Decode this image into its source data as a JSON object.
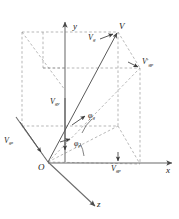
{
  "figure": {
    "type": "vector-decomposition-diagram",
    "colors": {
      "axis": "#6b6b6b",
      "dashed": "#8a8a8a",
      "vector": "#555555",
      "text": "#1a1a1a",
      "background": "#ffffff"
    },
    "axes": [
      {
        "id": "y",
        "label": "y",
        "direction": "up"
      },
      {
        "id": "x",
        "label": "x",
        "direction": "right"
      },
      {
        "id": "z",
        "label": "z",
        "direction": "down-right"
      }
    ],
    "points": [
      {
        "id": "origin",
        "label": "O"
      },
      {
        "id": "V",
        "label": "V"
      },
      {
        "id": "Vgp_prime",
        "label_base": "V",
        "label_sub": "gp",
        "prime": true
      },
      {
        "id": "Vgp",
        "label_base": "V",
        "label_sub": "gp",
        "prime": false
      }
    ],
    "vectors": [
      {
        "id": "Vg",
        "base": "V",
        "sub": "g",
        "description": "resultant vector from origin to V"
      },
      {
        "id": "Vgy",
        "base": "V",
        "sub": "gy",
        "description": "y-axis component, arrow pointing down along y"
      },
      {
        "id": "Vgz",
        "base": "V",
        "sub": "gz",
        "description": "component along negative z branch"
      },
      {
        "id": "Vgp",
        "base": "V",
        "sub": "gp",
        "description": "projection on x axis"
      },
      {
        "id": "Vgp_prime",
        "base": "V",
        "sub": "gp",
        "prime": true,
        "description": "projected vector in the x-z plane lifted to box face"
      }
    ],
    "angles": [
      {
        "id": "phi_g",
        "symbol": "φ",
        "sub": "g",
        "description": "elevation angle between V and its horizontal projection"
      },
      {
        "id": "phi_p",
        "symbol": "φ",
        "sub": "p",
        "description": "azimuth angle between x axis and horizontal projection"
      }
    ]
  }
}
